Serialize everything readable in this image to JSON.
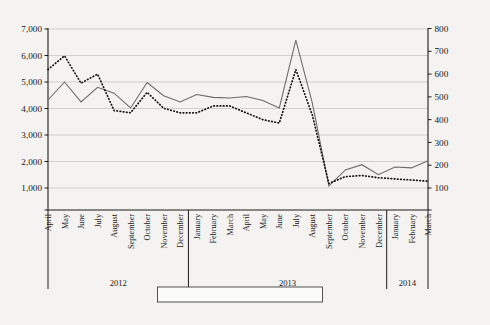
{
  "chart_data": {
    "type": "line",
    "title": "",
    "xlabel": "",
    "ylabel": "",
    "grid": true,
    "legend_position": "bottom-center",
    "categories": [
      "April",
      "May",
      "June",
      "July",
      "August",
      "September",
      "October",
      "November",
      "December",
      "January",
      "February",
      "March",
      "April",
      "May",
      "June",
      "July",
      "August",
      "September",
      "October",
      "November",
      "December",
      "January",
      "February",
      "March"
    ],
    "year_groups": [
      {
        "label": "2012",
        "start_index": 0,
        "end_index": 8
      },
      {
        "label": "2013",
        "start_index": 9,
        "end_index": 20
      },
      {
        "label": "2014",
        "start_index": 21,
        "end_index": 23
      }
    ],
    "axes": {
      "left": {
        "label": "",
        "ticks": [
          "1,000",
          "2,000",
          "3,000",
          "4,000",
          "5,000",
          "6,000",
          "7,000"
        ],
        "tick_values": [
          1000,
          2000,
          3000,
          4000,
          5000,
          6000,
          7000
        ],
        "ylim": [
          1000,
          7000
        ]
      },
      "right": {
        "label": "",
        "ticks": [
          "100",
          "200",
          "300",
          "400",
          "500",
          "600",
          "700",
          "800"
        ],
        "tick_values": [
          100,
          200,
          300,
          400,
          500,
          600,
          700,
          800
        ],
        "ylim": [
          100,
          800
        ]
      }
    },
    "series": [
      {
        "name": "Single cases",
        "style": "solid",
        "axis": "left",
        "color": "#6a6a6a",
        "values": [
          4320,
          5000,
          4250,
          4800,
          4580,
          4020,
          4980,
          4480,
          4250,
          4530,
          4420,
          4400,
          4450,
          4300,
          4020,
          6580,
          4200,
          1080,
          1680,
          1880,
          1500,
          1790,
          1760,
          2030
        ]
      },
      {
        "name": "Multiple cases",
        "style": "dotted",
        "axis": "right",
        "color": "#111111",
        "values": [
          620,
          680,
          560,
          600,
          440,
          430,
          520,
          450,
          430,
          430,
          460,
          460,
          430,
          400,
          385,
          620,
          420,
          120,
          150,
          155,
          145,
          140,
          135,
          130
        ]
      }
    ]
  },
  "legend": {
    "items": [
      {
        "label": "Single cases",
        "style": "solid"
      },
      {
        "label": "Multiple cases",
        "style": "dotted"
      }
    ]
  }
}
